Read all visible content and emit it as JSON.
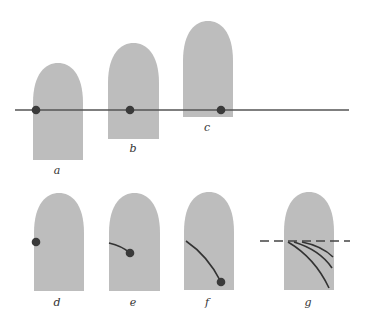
{
  "colors": {
    "shape_fill": "#bdbdbd",
    "dot": "#3a3a3a",
    "line": "#555555",
    "background": "#ffffff"
  },
  "panels": [
    {
      "label": "a",
      "x": 33,
      "top": 63,
      "w": 50,
      "bottom": 160,
      "dot": [
        36,
        110
      ],
      "label_pos": [
        57,
        165
      ]
    },
    {
      "label": "b",
      "x": 108,
      "top": 43,
      "w": 51,
      "bottom": 139,
      "dot": [
        130,
        110
      ],
      "label_pos": [
        133,
        143
      ]
    },
    {
      "label": "c",
      "x": 183,
      "top": 21,
      "w": 50,
      "bottom": 117,
      "dot": [
        221,
        110
      ],
      "label_pos": [
        207,
        122
      ]
    },
    {
      "label": "d",
      "x": 34,
      "top": 193,
      "w": 50,
      "bottom": 291,
      "dot": [
        36,
        242
      ],
      "label_pos": [
        57,
        297
      ]
    },
    {
      "label": "e",
      "x": 109,
      "top": 193,
      "w": 51,
      "bottom": 291,
      "dot": [
        130,
        253
      ],
      "curve": "M109,243 Q122,246 130,253",
      "label_pos": [
        133,
        297
      ]
    },
    {
      "label": "f",
      "x": 184,
      "top": 192,
      "w": 50,
      "bottom": 290,
      "dot": [
        221,
        282
      ],
      "curve": "M186,241 Q208,256 221,282",
      "label_pos": [
        207,
        297
      ]
    },
    {
      "label": "g",
      "x": 284,
      "top": 192,
      "w": 50,
      "bottom": 290,
      "curves": [
        "M288,242 Q315,258 329,288",
        "M294,242 Q320,250 332,268",
        "M302,242 Q322,246 333,257"
      ],
      "dashed_line": {
        "x1": 260,
        "x2": 350,
        "y": 241
      },
      "label_pos": [
        308,
        297
      ]
    }
  ],
  "horizontal_line": {
    "x1": 15,
    "x2": 349,
    "y": 110
  }
}
